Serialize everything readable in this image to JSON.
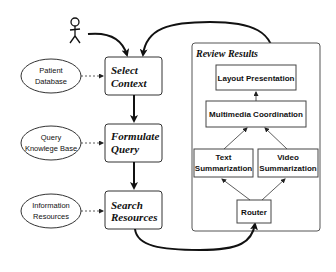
{
  "diagram": {
    "actor": {
      "name": "user"
    },
    "process_steps": [
      {
        "line1": "Select",
        "line2": "Context"
      },
      {
        "line1": "Formulate",
        "line2": "Query"
      },
      {
        "line1": "Search",
        "line2": "Resources"
      }
    ],
    "data_sources": [
      {
        "line1": "Patient",
        "line2": "Database"
      },
      {
        "line1": "Query",
        "line2": "Knowlege Base"
      },
      {
        "line1": "Information",
        "line2": "Resources"
      }
    ],
    "review_results": {
      "title": "Review  Results",
      "layout_presentation": "Layout Presentation",
      "multimedia_coordination": "Multimedia Coordination",
      "text_summarization": {
        "line1": "Text",
        "line2": "Summarization"
      },
      "video_summarization": {
        "line1": "Video",
        "line2": "Summarization"
      },
      "router": "Router"
    }
  }
}
